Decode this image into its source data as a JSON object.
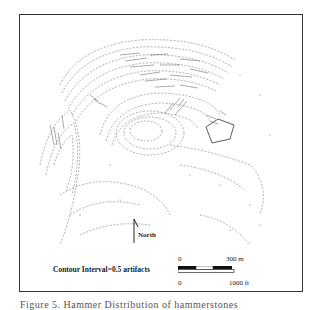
{
  "figure": {
    "caption": "Figure 5. Hammer Distribution of hammerstones",
    "legend": {
      "contour_interval": "Contour Interval=0.5 artifacts"
    },
    "north_arrow": {
      "label": "North"
    },
    "scale_bar": {
      "metric_start": "0",
      "metric_end": "300 m",
      "imperial_start": "0",
      "imperial_end": "1000 ft",
      "segments": [
        "black",
        "white",
        "black"
      ]
    },
    "colors": {
      "frame": "#333333",
      "contours": "#555555",
      "text": "#222222"
    }
  }
}
